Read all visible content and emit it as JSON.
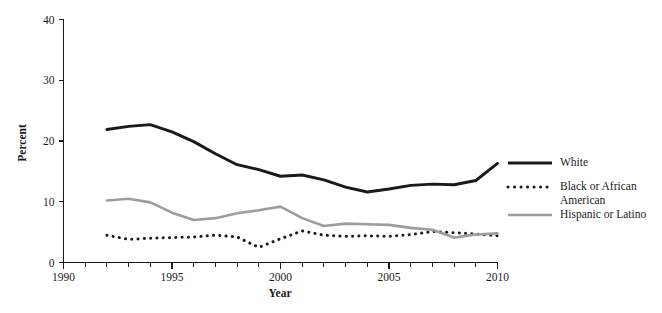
{
  "chart_data": {
    "type": "line",
    "title": "",
    "xlabel": "Year",
    "ylabel": "Percent",
    "xlim": [
      1990,
      2010
    ],
    "ylim": [
      0,
      40
    ],
    "y_ticks": [
      0,
      10,
      20,
      30,
      40
    ],
    "x_ticks": [
      1990,
      1995,
      2000,
      2005,
      2010
    ],
    "x_minor_tick_step": 1,
    "grid": false,
    "legend_position": "right",
    "x": [
      1992,
      1993,
      1994,
      1995,
      1996,
      1997,
      1998,
      1999,
      2000,
      2001,
      2002,
      2003,
      2004,
      2005,
      2006,
      2007,
      2008,
      2009,
      2010
    ],
    "series": [
      {
        "name": "White",
        "style": "solid",
        "color": "#1a1a1a",
        "values": [
          21.9,
          22.4,
          22.7,
          21.5,
          19.9,
          17.9,
          16.1,
          15.3,
          14.2,
          14.4,
          13.6,
          12.4,
          11.6,
          12.1,
          12.7,
          12.9,
          12.8,
          13.5,
          16.3
        ]
      },
      {
        "name": "Black or African American",
        "style": "dotted",
        "color": "#1a1a1a",
        "values": [
          4.5,
          3.8,
          4.0,
          4.1,
          4.2,
          4.5,
          4.2,
          2.5,
          3.9,
          5.2,
          4.5,
          4.3,
          4.4,
          4.3,
          4.6,
          5.1,
          4.9,
          4.7,
          4.4
        ]
      },
      {
        "name": "Hispanic or Latino",
        "style": "solid",
        "color": "#9d9d9d",
        "values": [
          10.2,
          10.5,
          9.9,
          8.2,
          7.0,
          7.3,
          8.1,
          8.6,
          9.2,
          7.3,
          6.0,
          6.4,
          6.3,
          6.2,
          5.7,
          5.4,
          4.1,
          4.6,
          4.8
        ]
      }
    ]
  },
  "axis": {
    "y_title": "Percent",
    "x_title": "Year",
    "y_tick_labels": [
      "0",
      "10",
      "20",
      "30",
      "40"
    ],
    "x_tick_labels": [
      "1990",
      "1995",
      "2000",
      "2005",
      "2010"
    ]
  },
  "legend": {
    "entries": [
      {
        "label": "White",
        "style": "solid-thick-black"
      },
      {
        "label": "Black or African",
        "label_line2": "American",
        "style": "dotted-black"
      },
      {
        "label": "Hispanic or Latino",
        "style": "solid-gray"
      }
    ]
  }
}
